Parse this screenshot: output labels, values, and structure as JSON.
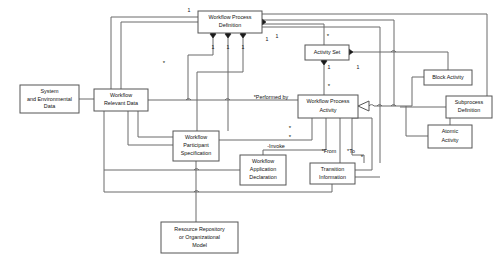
{
  "diagram": {
    "type": "uml-class-diagram",
    "canvas": {
      "width": 504,
      "height": 264,
      "background": "#ffffff"
    },
    "colors": {
      "box_stroke": "#555555",
      "box_fill": "#ffffff",
      "line": "#6a6a6a",
      "text": "#111111",
      "diamond": "#1a1a1a"
    },
    "entities": [
      {
        "id": "system-and-environmental-data",
        "label": "System\nand Environmental\nData",
        "lines": [
          "System",
          "and Environmental",
          "Data"
        ],
        "x": 20,
        "y": 85,
        "w": 59,
        "h": 28
      },
      {
        "id": "workflow-relevant-data",
        "label": "Workflow\nRelevant Data",
        "lines": [
          "Workflow",
          "Relevant Data"
        ],
        "x": 94,
        "y": 89,
        "w": 54,
        "h": 22
      },
      {
        "id": "workflow-process-definition",
        "label": "Workflow Process\nDefinition",
        "lines": [
          "Workflow Process",
          "Definition"
        ],
        "x": 198,
        "y": 11,
        "w": 64,
        "h": 22
      },
      {
        "id": "activity-set",
        "label": "Activity Set",
        "lines": [
          "Activity Set"
        ],
        "x": 305,
        "y": 45,
        "w": 44,
        "h": 15
      },
      {
        "id": "workflow-process-activity",
        "label": "Workflow Process\nActivity",
        "lines": [
          "Workflow Process",
          "Activity"
        ],
        "x": 298,
        "y": 95,
        "w": 60,
        "h": 23
      },
      {
        "id": "block-activity",
        "label": "Block Activity",
        "lines": [
          "Block Activity"
        ],
        "x": 424,
        "y": 70,
        "w": 48,
        "h": 15
      },
      {
        "id": "subprocess-definition",
        "label": "Subprocess\nDefinition",
        "lines": [
          "Subprocess",
          "Definition"
        ],
        "x": 446,
        "y": 96,
        "w": 46,
        "h": 22
      },
      {
        "id": "atomic-activity",
        "label": "Atomic\nActivity",
        "lines": [
          "Atomic",
          "Activity"
        ],
        "x": 428,
        "y": 125,
        "w": 44,
        "h": 23
      },
      {
        "id": "workflow-participant-specification",
        "label": "Workflow\nParticipant\nSpecification",
        "lines": [
          "Workflow",
          "Participant",
          "Specification"
        ],
        "x": 173,
        "y": 131,
        "w": 46,
        "h": 30
      },
      {
        "id": "workflow-application-declaration",
        "label": "Workflow\nApplication\nDeclaration",
        "lines": [
          "Workflow",
          "Application",
          "Declaration"
        ],
        "x": 240,
        "y": 155,
        "w": 46,
        "h": 30
      },
      {
        "id": "transition-information",
        "label": "Transition\nInformation",
        "lines": [
          "Transition",
          "Information"
        ],
        "x": 310,
        "y": 163,
        "w": 45,
        "h": 21
      },
      {
        "id": "resource-repository-or-organizational-model",
        "label": "Resource Repository\nor Organizational\nModel",
        "lines": [
          "Resource Repository",
          "or Organizational",
          "Model"
        ],
        "x": 161,
        "y": 222,
        "w": 77,
        "h": 31
      }
    ],
    "multiplicities": [
      {
        "id": "m-top-left-1",
        "text": "1",
        "x": 189,
        "y": 11
      },
      {
        "id": "m-wpd-child-1",
        "text": "1",
        "x": 213,
        "y": 48
      },
      {
        "id": "m-wpd-child-2",
        "text": "1",
        "x": 228,
        "y": 48
      },
      {
        "id": "m-wpd-child-3",
        "text": "1",
        "x": 243,
        "y": 48
      },
      {
        "id": "m-wpd-right-1",
        "text": "1",
        "x": 267,
        "y": 40
      },
      {
        "id": "m-wpd-right-2",
        "text": "1",
        "x": 277,
        "y": 37
      },
      {
        "id": "m-actset-star",
        "text": "*",
        "x": 328,
        "y": 36
      },
      {
        "id": "m-actset-down-1",
        "text": "1",
        "x": 329,
        "y": 68
      },
      {
        "id": "m-actset-right-1",
        "text": "1",
        "x": 358,
        "y": 68
      },
      {
        "id": "m-wpa-up-star",
        "text": "*",
        "x": 329,
        "y": 86
      },
      {
        "id": "m-wrd-star",
        "text": "*",
        "x": 164,
        "y": 63
      },
      {
        "id": "m-wrd-lower-star",
        "text": "*",
        "x": 290,
        "y": 128
      },
      {
        "id": "m-wps-star",
        "text": "*",
        "x": 290,
        "y": 137
      },
      {
        "id": "m-trans-star",
        "text": "*",
        "x": 362,
        "y": 157
      }
    ],
    "role_labels": [
      {
        "id": "performed-by",
        "text": "*Performed by",
        "x": 271,
        "y": 98
      },
      {
        "id": "invoke",
        "text": "-Invoke",
        "x": 276,
        "y": 147
      },
      {
        "id": "from",
        "text": "*From",
        "x": 329,
        "y": 152
      },
      {
        "id": "to",
        "text": "*To",
        "x": 351,
        "y": 152
      }
    ],
    "aggregation_diamonds": [
      {
        "id": "diamond-wpd-left",
        "x": 198,
        "y": 22
      },
      {
        "id": "diamond-wpd-right",
        "x": 262,
        "y": 22
      },
      {
        "id": "diamond-wpd-b1",
        "x": 213,
        "y": 37
      },
      {
        "id": "diamond-wpd-b2",
        "x": 228,
        "y": 37
      },
      {
        "id": "diamond-wpd-b3",
        "x": 243,
        "y": 37
      },
      {
        "id": "diamond-actset-right",
        "x": 349,
        "y": 52
      },
      {
        "id": "diamond-actset-bottom",
        "x": 324,
        "y": 61
      }
    ],
    "generalization": {
      "id": "generalization-arrow-activity",
      "x": 358,
      "y": 106,
      "note": "hollow triangle pointing left into Workflow Process Activity"
    }
  }
}
